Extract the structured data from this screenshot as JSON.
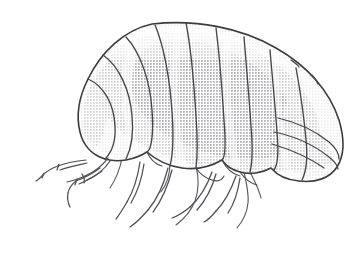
{
  "figure": {
    "title": "Isopod (woodlouse) lateral view line drawing",
    "subject_name": "woodlouse",
    "view": "lateral",
    "style": "ink line drawing with halftone stipple shading",
    "canvas": {
      "width": 362,
      "height": 274,
      "background_color": "#ffffff"
    },
    "colors": {
      "background": "#ffffff",
      "outline": "#3a3a3c",
      "segment_line": "#46464a",
      "leg_line": "#55555a",
      "shade_light": "#ebebeb",
      "shade_mid": "#dedede",
      "shade_dark": "#cfcfcf",
      "highlight": "#f7f7f7"
    },
    "anatomy": {
      "body_label": "carapace",
      "dorsal_segment_count": 9,
      "pleon_plate_count": 3,
      "leg_count": 6,
      "antenna_count": 2,
      "body_bounds": {
        "x": 78,
        "y": 22,
        "width": 265,
        "height": 160
      }
    },
    "parts": [
      {
        "name": "carapace-body",
        "label": "Segmented carapace"
      },
      {
        "name": "dorsal-segments",
        "label": "Dorsal tergite segments"
      },
      {
        "name": "pleon-plates",
        "label": "Posterior pleon plates"
      },
      {
        "name": "legs",
        "label": "Jointed pereopods"
      },
      {
        "name": "antennae",
        "label": "Antennae"
      },
      {
        "name": "halftone-shading",
        "label": "Stipple shading"
      }
    ]
  }
}
